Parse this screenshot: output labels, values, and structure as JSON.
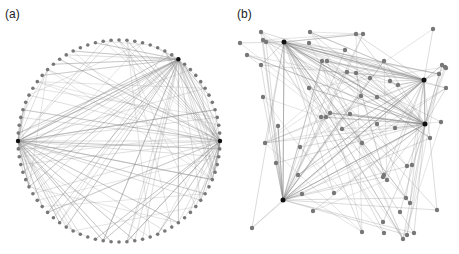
{
  "panels": [
    {
      "label": "(a)",
      "layout": "circular"
    },
    {
      "label": "(b)",
      "layout": "force-directed"
    }
  ],
  "style": {
    "edge_color": "#8a8a8a",
    "node_color": "#777777",
    "hub_color": "#111111",
    "background": "#ffffff"
  },
  "panel_a": {
    "center": [
      119,
      141
    ],
    "radius": 101,
    "node_count": 80,
    "hub_indices": [
      0,
      40,
      52
    ],
    "edge_seed": 7,
    "edges_per_hub": 45,
    "extra_edges": 40
  },
  "panel_b": {
    "hubs": [
      [
        284,
        42
      ],
      [
        424,
        80
      ],
      [
        425,
        124
      ],
      [
        283,
        200
      ]
    ],
    "nodes": [
      [
        261,
        32
      ],
      [
        240,
        43
      ],
      [
        263,
        40
      ],
      [
        266,
        42
      ],
      [
        310,
        32
      ],
      [
        356,
        34
      ],
      [
        363,
        34
      ],
      [
        433,
        29
      ],
      [
        247,
        55
      ],
      [
        261,
        65
      ],
      [
        309,
        43
      ],
      [
        345,
        50
      ],
      [
        322,
        61
      ],
      [
        327,
        61
      ],
      [
        384,
        61
      ],
      [
        442,
        65
      ],
      [
        445,
        67
      ],
      [
        446,
        68
      ],
      [
        347,
        72
      ],
      [
        356,
        73
      ],
      [
        370,
        78
      ],
      [
        390,
        81
      ],
      [
        398,
        85
      ],
      [
        439,
        74
      ],
      [
        263,
        97
      ],
      [
        309,
        88
      ],
      [
        377,
        97
      ],
      [
        361,
        96
      ],
      [
        446,
        88
      ],
      [
        330,
        113
      ],
      [
        321,
        117
      ],
      [
        326,
        117
      ],
      [
        350,
        114
      ],
      [
        377,
        124
      ],
      [
        395,
        128
      ],
      [
        441,
        122
      ],
      [
        278,
        126
      ],
      [
        342,
        129
      ],
      [
        430,
        138
      ],
      [
        300,
        147
      ],
      [
        265,
        143
      ],
      [
        362,
        143
      ],
      [
        412,
        165
      ],
      [
        407,
        166
      ],
      [
        276,
        163
      ],
      [
        298,
        175
      ],
      [
        384,
        175
      ],
      [
        383,
        177
      ],
      [
        387,
        180
      ],
      [
        302,
        194
      ],
      [
        334,
        193
      ],
      [
        406,
        198
      ],
      [
        410,
        203
      ],
      [
        313,
        211
      ],
      [
        400,
        212
      ],
      [
        437,
        210
      ],
      [
        383,
        222
      ],
      [
        252,
        228
      ],
      [
        362,
        232
      ],
      [
        384,
        233
      ],
      [
        403,
        239
      ],
      [
        407,
        235
      ],
      [
        414,
        233
      ]
    ],
    "edge_seed": 11,
    "extra_edges": 60
  }
}
